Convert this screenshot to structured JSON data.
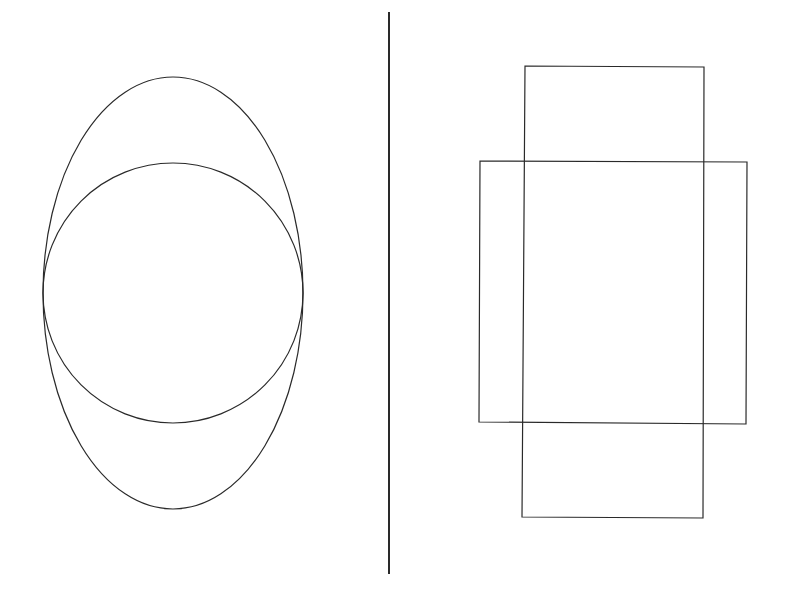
{
  "canvas": {
    "width": 794,
    "height": 603,
    "background": "#ffffff"
  },
  "stroke_color": "#2a2a2a",
  "left_panel": {
    "ellipse": {
      "cx": 173,
      "cy": 293,
      "rx": 130,
      "ry": 216
    },
    "circle": {
      "cx": 173,
      "cy": 293,
      "r": 130
    }
  },
  "divider": {
    "x": 389,
    "y1": 12,
    "y2": 574,
    "width": 2
  },
  "right_panel": {
    "tall_rect": {
      "points": "525,66 704,67 703,518 522,517"
    },
    "wide_rect": {
      "points": "480,161 747,162 746,424 479,422"
    }
  }
}
